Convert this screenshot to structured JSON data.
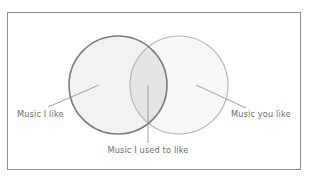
{
  "figure": {
    "type": "venn-diagram",
    "sets": 2,
    "background_color": "#ffffff",
    "frame": {
      "name": "outer-border",
      "visible": true,
      "border_color": "#8c8c8c",
      "x": 7.5,
      "y": 12.5,
      "width": 293,
      "height": 157
    },
    "circles": [
      {
        "id": "left",
        "label": "Music I like",
        "cx": 118,
        "cy": 85,
        "r": 49,
        "stroke": "#7b7b7b",
        "stroke_width": 1.6,
        "fill": "#f2f2f2"
      },
      {
        "id": "right",
        "label": "Music you like",
        "cx": 179,
        "cy": 85,
        "r": 49,
        "stroke": "#b3b3b3",
        "stroke_width": 1.1,
        "fill": "#f7f7f7"
      }
    ],
    "intersection": {
      "id": "overlap",
      "label": "Music I used to like",
      "fill": "#e4e4e4"
    },
    "labels": [
      {
        "id": "left-label",
        "text": "Music I like",
        "anchor": "start",
        "x": 17,
        "y": 117,
        "color": "#6e6e6e",
        "leader": {
          "x1": 48,
          "y1": 107,
          "x2": 99,
          "y2": 85
        }
      },
      {
        "id": "center-label",
        "text": "Music I used to like",
        "anchor": "middle",
        "x": 148,
        "y": 153,
        "color": "#6e6e6e",
        "leader": {
          "x1": 148,
          "y1": 143,
          "x2": 148,
          "y2": 85
        }
      },
      {
        "id": "right-label",
        "text": "Music you like",
        "anchor": "start",
        "x": 231,
        "y": 117,
        "color": "#6e6e6e",
        "leader": {
          "x1": 196,
          "y1": 85,
          "x2": 246,
          "y2": 108
        }
      }
    ],
    "leader_line": {
      "color": "#8a8a8a",
      "width": 0.8
    }
  },
  "chart_data": {
    "type": "venn",
    "title": "",
    "sets": [
      {
        "name": "Music I like",
        "position": "left"
      },
      {
        "name": "Music you like",
        "position": "right"
      }
    ],
    "regions": [
      {
        "name": "Music I like",
        "region": "left-only"
      },
      {
        "name": "Music I used to like",
        "region": "intersection"
      },
      {
        "name": "Music you like",
        "region": "right-only"
      }
    ],
    "legend": "none",
    "grid": false
  }
}
